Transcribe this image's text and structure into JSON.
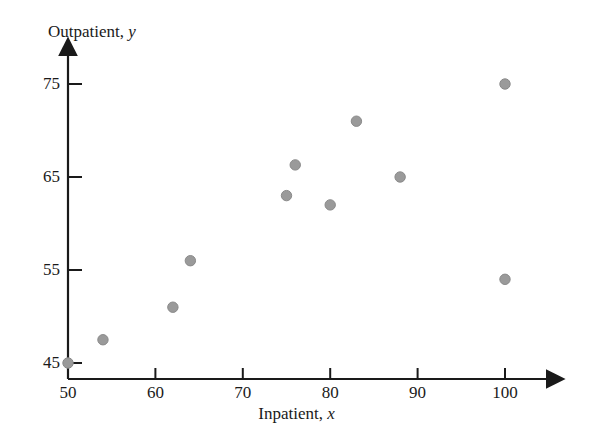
{
  "chart_data": {
    "type": "scatter",
    "title": "",
    "xlabel": "Inpatient, x",
    "xlabel_text": "Inpatient,",
    "xlabel_var": "x",
    "ylabel": "Outpatient, y",
    "ylabel_text": "Outpatient,",
    "ylabel_var": "y",
    "xlim": [
      46,
      105
    ],
    "ylim": [
      43,
      78
    ],
    "xticks": [
      50,
      60,
      70,
      80,
      90,
      100
    ],
    "yticks": [
      45,
      55,
      65,
      75
    ],
    "grid": false,
    "legend": null,
    "marker_color": "#9a9a9a",
    "marker_edge_color": "#8a8a8a",
    "axis_color": "#1a1a1a",
    "points": [
      {
        "x": 50,
        "y": 45
      },
      {
        "x": 54,
        "y": 47.5
      },
      {
        "x": 62,
        "y": 51
      },
      {
        "x": 64,
        "y": 56
      },
      {
        "x": 75,
        "y": 63
      },
      {
        "x": 76,
        "y": 66.3
      },
      {
        "x": 80,
        "y": 62
      },
      {
        "x": 83,
        "y": 71
      },
      {
        "x": 88,
        "y": 65
      },
      {
        "x": 100,
        "y": 75
      },
      {
        "x": 100,
        "y": 54
      }
    ]
  }
}
